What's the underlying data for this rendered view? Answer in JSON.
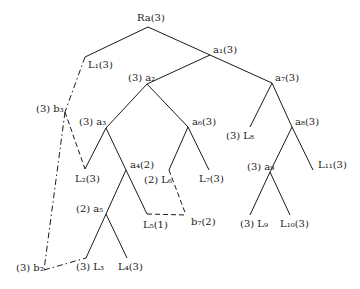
{
  "diagram": {
    "type": "tree",
    "nodes": [
      {
        "id": "Ra",
        "label": "Ra(3)",
        "x": 148,
        "y": 27,
        "lx": 137,
        "ly": 13
      },
      {
        "id": "L1",
        "label": "L₁(3)",
        "x": 85,
        "y": 57,
        "lx": 88,
        "ly": 60
      },
      {
        "id": "a1",
        "label": "a₁(3)",
        "x": 210,
        "y": 55,
        "lx": 213,
        "ly": 45
      },
      {
        "id": "a2",
        "label": "(3) a₂",
        "x": 147,
        "y": 84,
        "lx": 128,
        "ly": 73
      },
      {
        "id": "a7",
        "label": "a₇(3)",
        "x": 272,
        "y": 83,
        "lx": 275,
        "ly": 73
      },
      {
        "id": "b3",
        "label": "(3) b₃",
        "x": 65,
        "y": 112,
        "lx": 36,
        "ly": 104
      },
      {
        "id": "a3",
        "label": "(3) a₃",
        "x": 106,
        "y": 128,
        "lx": 79,
        "ly": 117
      },
      {
        "id": "a6",
        "label": "a₆(3)",
        "x": 188,
        "y": 127,
        "lx": 192,
        "ly": 117
      },
      {
        "id": "L8",
        "label": "(3) L₈",
        "x": 250,
        "y": 127,
        "lx": 226,
        "ly": 131
      },
      {
        "id": "a8",
        "label": "a₈(3)",
        "x": 292,
        "y": 127,
        "lx": 295,
        "ly": 117
      },
      {
        "id": "L2",
        "label": "L₂(3)",
        "x": 85,
        "y": 169,
        "lx": 75,
        "ly": 174
      },
      {
        "id": "a4",
        "label": "a₄(2)",
        "x": 126,
        "y": 170,
        "lx": 130,
        "ly": 160
      },
      {
        "id": "L6",
        "label": "(2) L₆",
        "x": 169,
        "y": 170,
        "lx": 144,
        "ly": 175
      },
      {
        "id": "L7",
        "label": "L₇(3)",
        "x": 209,
        "y": 170,
        "lx": 199,
        "ly": 174
      },
      {
        "id": "a9",
        "label": "(3) a₉",
        "x": 270,
        "y": 172,
        "lx": 247,
        "ly": 162
      },
      {
        "id": "L11",
        "label": "L₁₁(3)",
        "x": 313,
        "y": 170,
        "lx": 318,
        "ly": 160
      },
      {
        "id": "a5",
        "label": "(2) a₅",
        "x": 106,
        "y": 214,
        "lx": 76,
        "ly": 204
      },
      {
        "id": "L5",
        "label": "L₅(1)",
        "x": 147,
        "y": 214,
        "lx": 143,
        "ly": 220
      },
      {
        "id": "b7",
        "label": "b₇(2)",
        "x": 186,
        "y": 215,
        "lx": 191,
        "ly": 217
      },
      {
        "id": "L9",
        "label": "(3) L₉",
        "x": 250,
        "y": 215,
        "lx": 240,
        "ly": 219
      },
      {
        "id": "L10",
        "label": "L₁₀(3)",
        "x": 290,
        "y": 215,
        "lx": 280,
        "ly": 219
      },
      {
        "id": "L3",
        "label": "(3) L₃",
        "x": 86,
        "y": 258,
        "lx": 76,
        "ly": 262
      },
      {
        "id": "L4",
        "label": "L₄(3)",
        "x": 127,
        "y": 258,
        "lx": 118,
        "ly": 262
      },
      {
        "id": "b2",
        "label": "(3) b₂",
        "x": 44,
        "y": 270,
        "lx": 16,
        "ly": 263
      }
    ],
    "edges": [
      {
        "from": "Ra",
        "to": "L1",
        "style": "solid"
      },
      {
        "from": "Ra",
        "to": "a1",
        "style": "solid"
      },
      {
        "from": "a1",
        "to": "a2",
        "style": "solid"
      },
      {
        "from": "a1",
        "to": "a7",
        "style": "solid"
      },
      {
        "from": "a2",
        "to": "a3",
        "style": "solid"
      },
      {
        "from": "a2",
        "to": "a6",
        "style": "solid"
      },
      {
        "from": "a7",
        "to": "L8",
        "style": "solid"
      },
      {
        "from": "a7",
        "to": "a8",
        "style": "solid"
      },
      {
        "from": "a3",
        "to": "L2",
        "style": "solid"
      },
      {
        "from": "a3",
        "to": "a4",
        "style": "solid"
      },
      {
        "from": "a6",
        "to": "L6",
        "style": "solid"
      },
      {
        "from": "a6",
        "to": "L7",
        "style": "solid"
      },
      {
        "from": "a8",
        "to": "a9",
        "style": "solid"
      },
      {
        "from": "a8",
        "to": "L11",
        "style": "solid"
      },
      {
        "from": "a4",
        "to": "a5",
        "style": "solid"
      },
      {
        "from": "a4",
        "to": "L5",
        "style": "solid"
      },
      {
        "from": "a9",
        "to": "L9",
        "style": "solid"
      },
      {
        "from": "a9",
        "to": "L10",
        "style": "solid"
      },
      {
        "from": "a5",
        "to": "L3",
        "style": "solid"
      },
      {
        "from": "a5",
        "to": "L4",
        "style": "solid"
      },
      {
        "from": "L1",
        "to": "b3",
        "style": "dashdot"
      },
      {
        "from": "b3",
        "to": "L2",
        "style": "dashed"
      },
      {
        "from": "b3",
        "to": "b2",
        "style": "dashdot"
      },
      {
        "from": "b2",
        "to": "L3",
        "style": "dashdot"
      },
      {
        "from": "L6",
        "to": "b7",
        "style": "dashed"
      },
      {
        "from": "L5",
        "to": "b7",
        "style": "dashed"
      }
    ],
    "colors": {
      "line": "#1a1a1a",
      "background": "#ffffff"
    }
  }
}
